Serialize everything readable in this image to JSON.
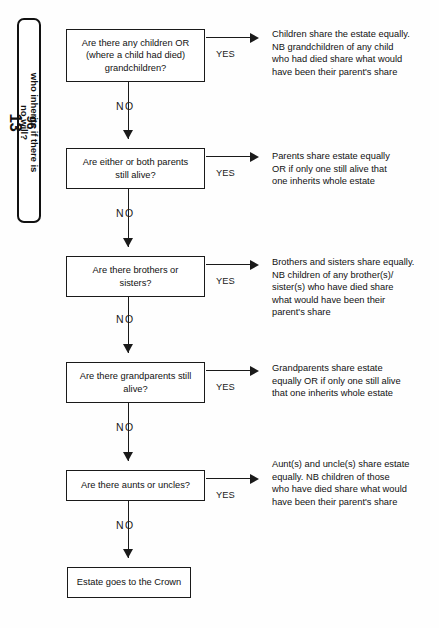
{
  "page": {
    "width": 439,
    "height": 628,
    "background": "#fefefe",
    "ink": "#1a1a1a"
  },
  "side_tab": {
    "page_number": "96",
    "title": "who inherits if there is",
    "title_line2": "no will?",
    "chapter_number": "13"
  },
  "flow": {
    "yes_label": "YES",
    "no_label": "NO",
    "steps": [
      {
        "id": "children",
        "question_lines": [
          "Are there any children OR",
          "(where a child had died)",
          "grandchildren?"
        ],
        "outcome_lines": [
          "Children share the estate equally.",
          "NB grandchildren of any child",
          "who had died share what would",
          "have been their parent's share"
        ]
      },
      {
        "id": "parents",
        "question_lines": [
          "Are either or both parents",
          "still alive?"
        ],
        "outcome_lines": [
          "Parents share estate equally",
          "OR if only one still alive that",
          "one inherits whole estate"
        ]
      },
      {
        "id": "siblings",
        "question_lines": [
          "Are there brothers or",
          "sisters?"
        ],
        "outcome_lines": [
          "Brothers and sisters share equally.",
          "NB children of any brother(s)/",
          "sister(s) who have died share",
          "what would have been their",
          "parent's share"
        ]
      },
      {
        "id": "grandparents",
        "question_lines": [
          "Are there grandparents still",
          "alive?"
        ],
        "outcome_lines": [
          "Grandparents share estate",
          "equally OR if only one still alive",
          "that one inherits whole estate"
        ]
      },
      {
        "id": "aunts-uncles",
        "question_lines": [
          "Are there aunts or uncles?"
        ],
        "outcome_lines": [
          "Aunt(s) and uncle(s) share estate",
          "equally. NB children of those",
          "who have died share what would",
          "have been their parent's share"
        ]
      }
    ],
    "terminal": {
      "id": "crown",
      "label": "Estate goes to the Crown"
    }
  }
}
